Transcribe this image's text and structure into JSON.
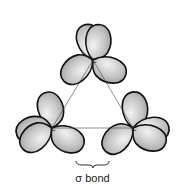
{
  "diagram": {
    "atoms": [
      {
        "label": "C",
        "position": "top"
      },
      {
        "label": "C",
        "position": "bottom-left"
      },
      {
        "label": "C",
        "position": "bottom-right"
      }
    ],
    "annotation": {
      "label": "σ bond",
      "marker": "brace"
    },
    "colors": {
      "lobe_fill": "#c8c8c8",
      "lobe_stroke": "#111111",
      "background": "#ffffff"
    }
  }
}
